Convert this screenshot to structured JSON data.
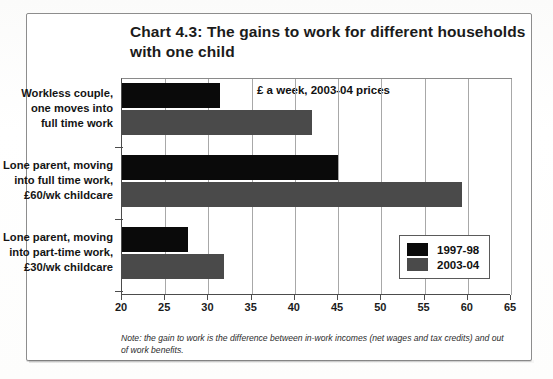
{
  "title": "Chart 4.3: The gains to work for different households with one child",
  "note": "Note: the gain to work is the difference between in-work incomes (net wages and tax credits) and out of work benefits.",
  "legend": {
    "items": [
      {
        "label": "1997-98",
        "color": "#0a0a0a"
      },
      {
        "label": "2003-04",
        "color": "#4a4a4a"
      }
    ]
  },
  "chart_data": {
    "type": "bar",
    "orientation": "horizontal",
    "title": "Chart 4.3: The gains to work for different households with one child",
    "subtitle": "£ a week, 2003-04 prices",
    "xlabel": "",
    "ylabel": "",
    "xlim": [
      20,
      65
    ],
    "xticks": [
      20,
      25,
      30,
      35,
      40,
      45,
      50,
      55,
      60,
      65
    ],
    "xticklabels": [
      "20",
      "25",
      "30",
      "35",
      "40",
      "45",
      "50",
      "55",
      "60",
      "65"
    ],
    "grid": true,
    "grid_axis": "x",
    "legend_position": "lower right",
    "categories": [
      "Workless couple, one moves into full time work",
      "Lone parent, moving into full time work, £60/wk childcare",
      "Lone parent, moving into part-time work, £30/wk childcare"
    ],
    "category_lines": [
      [
        "Workless couple,",
        "one moves into",
        "full time work"
      ],
      [
        "Lone parent, moving",
        "into full time work,",
        "£60/wk childcare"
      ],
      [
        "Lone parent, moving",
        "into part-time work,",
        "£30/wk childcare"
      ]
    ],
    "series": [
      {
        "name": "1997-98",
        "color": "#0a0a0a",
        "values": [
          31.3,
          45.0,
          27.6
        ]
      },
      {
        "name": "2003-04",
        "color": "#4a4a4a",
        "values": [
          42.0,
          59.3,
          31.8
        ]
      }
    ],
    "note": "Note: the gain to work is the difference between in-work incomes (net wages and tax credits) and out of work benefits."
  }
}
